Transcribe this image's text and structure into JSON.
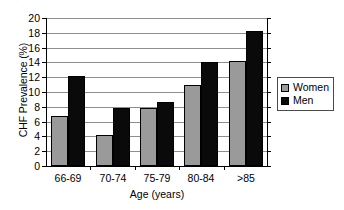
{
  "chart_data": {
    "type": "bar",
    "title": "",
    "xlabel": "Age (years)",
    "ylabel": "CHF Prevalence (%)",
    "ylim": [
      0,
      20
    ],
    "ytick_step": 2,
    "yticks": [
      "20",
      "18",
      "16",
      "14",
      "12",
      "10",
      "8",
      "6",
      "4",
      "2",
      "0"
    ],
    "grid": true,
    "legend_position": "right",
    "categories": [
      "66-69",
      "70-74",
      "75-79",
      "80-84",
      ">85"
    ],
    "series": [
      {
        "name": "Women",
        "color": "#9a9a9a",
        "values": [
          6.7,
          4.2,
          7.9,
          11.0,
          14.2
        ]
      },
      {
        "name": "Men",
        "color": "#0a0a0a",
        "values": [
          12.1,
          7.8,
          8.7,
          14.1,
          18.3
        ]
      }
    ]
  },
  "legend": {
    "items": [
      {
        "label": "Women"
      },
      {
        "label": "Men"
      }
    ]
  }
}
